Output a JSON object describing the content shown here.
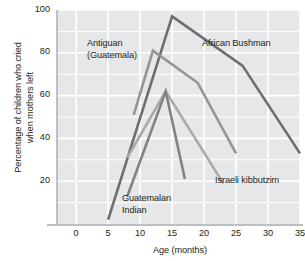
{
  "chart_data": {
    "type": "line",
    "title": "",
    "xlabel": "Age (months)",
    "ylabel": "Percentage of children\nwho cried when mothers left",
    "xlim": [
      -3,
      35
    ],
    "ylim": [
      0,
      100
    ],
    "xticks": [
      0,
      5,
      10,
      15,
      20,
      25,
      30,
      35
    ],
    "yticks": [
      20,
      40,
      60,
      80,
      100
    ],
    "grid": true,
    "legend_position": "inline-annotations",
    "series": [
      {
        "name": "African Bushman",
        "color": "#6d6e71",
        "x": [
          5,
          15,
          26,
          35
        ],
        "y": [
          2,
          97,
          74,
          33
        ]
      },
      {
        "name": "Antiguan (Guatemala)",
        "color": "#939598",
        "x": [
          9,
          12,
          19,
          25
        ],
        "y": [
          51,
          81,
          66,
          33
        ]
      },
      {
        "name": "Israeli kibbutzim",
        "color": "#a7a9ac",
        "x": [
          8,
          14,
          23
        ],
        "y": [
          31,
          62,
          19
        ]
      },
      {
        "name": "Guatemalan Indian",
        "color": "#808285",
        "x": [
          8,
          14,
          17
        ],
        "y": [
          13,
          62,
          21
        ]
      }
    ],
    "annotations": [
      {
        "text": "Antiguan\n(Guatemala)",
        "x_px": 87,
        "y_px": 38
      },
      {
        "text": "African Bushman",
        "x_px": 202,
        "y_px": 38
      },
      {
        "text": "Israeli kibbutzim",
        "x_px": 215,
        "y_px": 175
      },
      {
        "text": "Guatemalan\nIndian",
        "x_px": 122,
        "y_px": 193
      }
    ],
    "colors": {
      "plot_background": "#e6e7e8",
      "gridlines": "#ffffff",
      "axis": "#a7a9ac",
      "text": "#231f20"
    }
  }
}
